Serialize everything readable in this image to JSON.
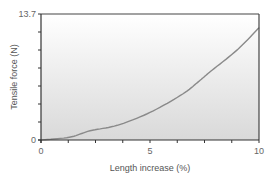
{
  "chart_data": {
    "type": "line",
    "title": "",
    "xlabel": "Length increase (%)",
    "ylabel": "Tensile force (N)",
    "xlim": [
      0,
      10
    ],
    "ylim": [
      0,
      13.7
    ],
    "x_ticks": [
      "0",
      "5",
      "10"
    ],
    "y_ticks": [
      "0",
      "13.7"
    ],
    "grid": false,
    "legend": null,
    "series": [
      {
        "name": "Tensile force",
        "x": [
          0,
          1.3,
          2.25,
          3.5,
          5,
          6.5,
          7.3,
          7.75,
          9,
          10
        ],
        "y": [
          0,
          0.3,
          1.0,
          1.6,
          3.0,
          5.0,
          6.5,
          7.4,
          9.8,
          12.2
        ]
      }
    ]
  },
  "colors": {
    "line": "#8a8a8a",
    "axis": "#333333",
    "bg_top": "#ffffff",
    "bg_bottom": "#dcdcdc"
  }
}
